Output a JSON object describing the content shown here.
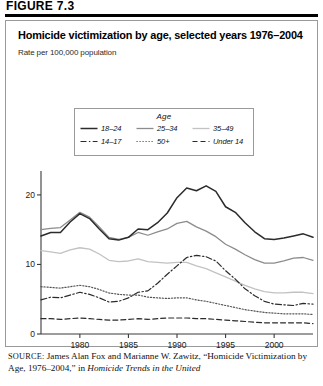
{
  "figure": {
    "label": "FIGURE 7.3"
  },
  "chart_data": {
    "type": "line",
    "title": "Homicide victimization by age, selected years 1976–2004",
    "subtitle": "Rate per 100,000 population",
    "xlabel": "",
    "ylabel": "Rate per 100,000 population",
    "legend_title": "Age",
    "legend_position": "top-center",
    "grid": false,
    "xlim": [
      1976,
      2004
    ],
    "ylim": [
      0,
      22
    ],
    "yticks": [
      "0",
      "10",
      "20"
    ],
    "ytick_values": [
      0,
      10,
      20
    ],
    "xticks": [
      "1980",
      "1985",
      "1990",
      "1995",
      "2000"
    ],
    "xtick_values": [
      1980,
      1985,
      1990,
      1995,
      2000
    ],
    "x": [
      1976,
      1977,
      1978,
      1979,
      1980,
      1981,
      1982,
      1983,
      1984,
      1985,
      1986,
      1987,
      1988,
      1989,
      1990,
      1991,
      1992,
      1993,
      1994,
      1995,
      1996,
      1997,
      1998,
      1999,
      2000,
      2001,
      2002,
      2003,
      2004
    ],
    "series": [
      {
        "name": "18–24",
        "style": "solid",
        "color": "#2b2b2b",
        "width": 1.5,
        "values": [
          14.1,
          14.6,
          14.6,
          16.1,
          17.3,
          16.6,
          15.1,
          13.7,
          13.5,
          13.9,
          15.1,
          15.0,
          16.0,
          17.4,
          19.6,
          21.0,
          20.6,
          21.3,
          20.5,
          18.3,
          17.5,
          16.0,
          14.7,
          13.7,
          13.6,
          13.8,
          14.1,
          14.4,
          13.9
        ]
      },
      {
        "name": "25–34",
        "style": "solid",
        "color": "#8c8c8c",
        "width": 1.3,
        "values": [
          15.0,
          15.2,
          15.3,
          16.4,
          17.5,
          16.8,
          15.4,
          13.9,
          13.6,
          13.9,
          14.6,
          14.2,
          14.7,
          15.1,
          15.9,
          16.2,
          15.4,
          14.8,
          14.0,
          12.9,
          12.2,
          11.4,
          10.7,
          10.2,
          10.2,
          10.5,
          10.9,
          11.0,
          10.6
        ]
      },
      {
        "name": "35–49",
        "style": "solid",
        "color": "#c2c2c2",
        "width": 1.3,
        "values": [
          12.0,
          11.8,
          11.6,
          12.1,
          12.4,
          12.2,
          11.5,
          10.6,
          10.4,
          10.5,
          10.8,
          10.4,
          10.3,
          10.2,
          10.3,
          10.3,
          9.8,
          9.4,
          8.8,
          8.2,
          7.6,
          7.0,
          6.5,
          6.1,
          5.9,
          5.9,
          6.0,
          6.0,
          5.8
        ]
      },
      {
        "name": "14–17",
        "style": "dashdot",
        "color": "#2b2b2b",
        "width": 1.2,
        "values": [
          4.9,
          5.3,
          5.2,
          5.6,
          6.0,
          5.7,
          5.2,
          4.6,
          4.7,
          5.2,
          6.0,
          6.2,
          7.3,
          8.6,
          9.8,
          11.0,
          11.3,
          11.1,
          10.5,
          9.1,
          7.9,
          6.5,
          5.5,
          4.7,
          4.3,
          4.2,
          4.1,
          4.4,
          4.3
        ]
      },
      {
        "name": "50+",
        "style": "dotted",
        "color": "#555555",
        "width": 1.2,
        "values": [
          6.8,
          6.7,
          6.6,
          6.8,
          7.0,
          6.8,
          6.4,
          5.9,
          5.7,
          5.6,
          5.6,
          5.3,
          5.2,
          5.1,
          5.2,
          5.2,
          4.9,
          4.7,
          4.4,
          4.1,
          3.8,
          3.5,
          3.3,
          3.1,
          3.0,
          2.9,
          2.9,
          2.9,
          2.8
        ]
      },
      {
        "name": "Under 14",
        "style": "dashed",
        "color": "#2b2b2b",
        "width": 1.2,
        "values": [
          2.2,
          2.2,
          2.1,
          2.2,
          2.3,
          2.2,
          2.1,
          2.0,
          2.0,
          2.1,
          2.2,
          2.1,
          2.2,
          2.3,
          2.3,
          2.3,
          2.2,
          2.2,
          2.1,
          2.0,
          1.9,
          1.8,
          1.7,
          1.6,
          1.6,
          1.6,
          1.6,
          1.6,
          1.5
        ]
      }
    ]
  },
  "source": {
    "prefix": "SOURCE:",
    "text_1": " James Alan Fox and Marianne W. Zawitz, “Homicide Victimization by Age, 1976–2004,” in ",
    "italic_1": "Homicide Trends in the United"
  }
}
